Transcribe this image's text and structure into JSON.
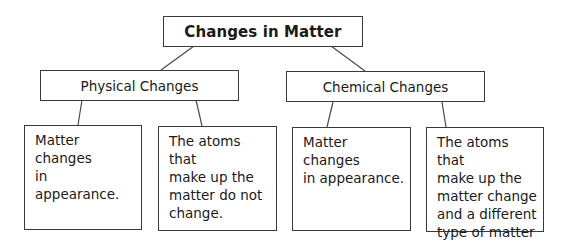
{
  "diagram": {
    "title": "Changes in Matter",
    "categories": [
      {
        "label": "Physical Changes",
        "items": [
          "Matter changes\nin appearance.",
          "The atoms that\nmake up the\nmatter do not\nchange."
        ]
      },
      {
        "label": "Chemical Changes",
        "items": [
          "Matter changes\nin appearance.",
          "The atoms that\nmake up the\nmatter change\nand a different\ntype of matter\nis formed."
        ]
      }
    ],
    "colors": {
      "line": "#3a3a3a",
      "background": "#ffffff",
      "text": "#1a1a1a"
    }
  }
}
